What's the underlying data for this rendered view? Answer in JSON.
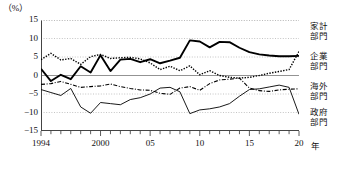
{
  "unit_label": "（%）",
  "axis": {
    "x_unit_label": "年",
    "y_ticks": [
      "15",
      "10",
      "5",
      "0",
      "-5",
      "-10",
      "-15"
    ],
    "y_tick_values": [
      15,
      10,
      5,
      0,
      -5,
      -10,
      -15
    ],
    "x_ticks": [
      "1994",
      "2000",
      "05",
      "10",
      "15",
      "20"
    ],
    "x_tick_values": [
      1994,
      2000,
      2005,
      2010,
      2015,
      2020
    ]
  },
  "legend": [
    {
      "label_line1": "家計",
      "label_line2": "部門",
      "style": "thick-solid",
      "color": "#000000"
    },
    {
      "label_line1": "企業",
      "label_line2": "部門",
      "style": "dotted",
      "color": "#000000"
    },
    {
      "label_line1": "海外",
      "label_line2": "部門",
      "style": "dash-dot",
      "color": "#000000"
    },
    {
      "label_line1": "政府",
      "label_line2": "部門",
      "style": "thin-solid",
      "color": "#000000"
    }
  ],
  "chart_data": {
    "type": "line",
    "title": "",
    "xlabel": "年",
    "ylabel": "(%)",
    "xlim": [
      1994,
      2020
    ],
    "ylim": [
      -15,
      15
    ],
    "grid": true,
    "legend_position": "right",
    "x": [
      1994,
      1995,
      1996,
      1997,
      1998,
      1999,
      2000,
      2001,
      2002,
      2003,
      2004,
      2005,
      2006,
      2007,
      2008,
      2009,
      2010,
      2011,
      2012,
      2013,
      2014,
      2015,
      2016,
      2017,
      2018,
      2019,
      2020
    ],
    "series": [
      {
        "name": "家計部門",
        "style": "thick-solid",
        "values": [
          1.8,
          -1.5,
          0.2,
          -1.0,
          2.5,
          0.8,
          5.5,
          1.2,
          4.3,
          4.5,
          3.6,
          4.4,
          3.3,
          4.0,
          4.8,
          9.5,
          9.2,
          7.6,
          9.1,
          9.0,
          7.5,
          6.3,
          5.7,
          5.4,
          5.2,
          5.2,
          5.3
        ]
      },
      {
        "name": "企業部門",
        "style": "dotted",
        "values": [
          4.3,
          6.0,
          4.2,
          4.6,
          3.0,
          5.1,
          5.7,
          4.6,
          4.8,
          4.9,
          4.5,
          3.4,
          1.6,
          2.5,
          1.3,
          2.6,
          0.2,
          1.3,
          0.0,
          -0.5,
          -0.7,
          -0.5,
          0.0,
          0.6,
          1.1,
          1.6,
          6.5
        ]
      },
      {
        "name": "海外部門",
        "style": "dash-dot",
        "values": [
          -2.4,
          -2.2,
          -1.6,
          -2.4,
          -3.2,
          -3.0,
          -2.8,
          -2.3,
          -3.0,
          -3.5,
          -3.9,
          -4.0,
          -4.8,
          -5.1,
          -3.4,
          -3.0,
          -4.0,
          -2.2,
          -1.2,
          -1.0,
          -0.7,
          -3.4,
          -4.1,
          -4.3,
          -3.9,
          -3.7,
          -3.6
        ]
      },
      {
        "name": "政府部門",
        "style": "thin-solid",
        "values": [
          -3.8,
          -4.6,
          -5.4,
          -3.5,
          -8.5,
          -10.2,
          -7.3,
          -7.6,
          -7.9,
          -6.5,
          -6.0,
          -5.0,
          -3.4,
          -3.2,
          -4.4,
          -10.3,
          -9.3,
          -9.0,
          -8.5,
          -7.6,
          -5.6,
          -3.8,
          -3.6,
          -3.1,
          -2.6,
          -3.2,
          -10.5
        ]
      }
    ]
  }
}
